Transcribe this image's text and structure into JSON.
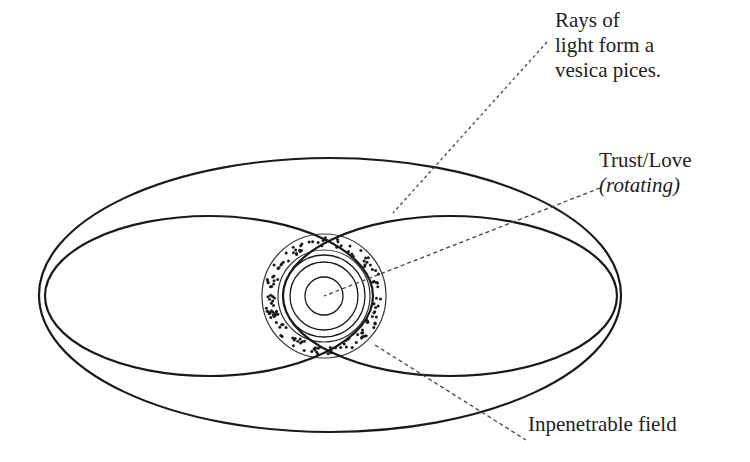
{
  "diagram": {
    "colors": {
      "stroke": "#1a1a1a",
      "dash": "#444444",
      "dots": "#1a1a1a",
      "background": "#ffffff"
    },
    "labels": {
      "rays": {
        "lines": [
          "Rays of",
          "light form a",
          "vesica pices."
        ]
      },
      "trust": {
        "line1": "Trust/Love",
        "line2": "(rotating)"
      },
      "field": {
        "text": "Inpenetrable field"
      }
    },
    "shapes": {
      "outer_ellipse": {
        "cx": 330,
        "cy": 295,
        "rx": 291,
        "ry": 137
      },
      "left_lobe": {
        "cx": 209,
        "cy": 296,
        "rx": 164,
        "ry": 80
      },
      "right_lobe": {
        "cx": 450,
        "cy": 296,
        "rx": 167,
        "ry": 80
      },
      "field_ring": {
        "cx": 324,
        "cy": 296,
        "r_outer": 62,
        "r_inner": 46
      },
      "core_rings": [
        40,
        36,
        19
      ]
    },
    "leaders": {
      "rays": {
        "x1": 547,
        "y1": 42,
        "x2": 393,
        "y2": 213
      },
      "trust": {
        "x1": 600,
        "y1": 188,
        "x2": 324,
        "y2": 296
      },
      "field": {
        "x1": 375,
        "y1": 345,
        "x2": 526,
        "y2": 440
      }
    }
  }
}
